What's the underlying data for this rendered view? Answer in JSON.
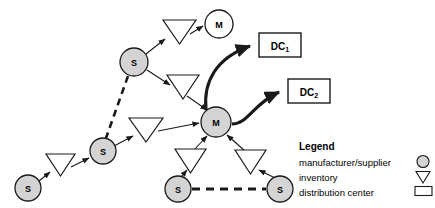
{
  "diagram": {
    "colors": {
      "node_fill_gray": "#d4d4d4",
      "node_fill_white": "#ffffff",
      "stroke": "#1a1a1a",
      "background": "#ffffff"
    },
    "nodes": [
      {
        "id": "m_top",
        "label": "M",
        "type": "manufacturer-supplier",
        "fill": "white",
        "cx": 219,
        "cy": 24,
        "r": 14
      },
      {
        "id": "s_upper",
        "label": "S",
        "type": "manufacturer-supplier",
        "fill": "gray",
        "cx": 134,
        "cy": 62,
        "r": 14
      },
      {
        "id": "m_center",
        "label": "M",
        "type": "manufacturer-supplier",
        "fill": "gray",
        "cx": 216,
        "cy": 122,
        "r": 15
      },
      {
        "id": "s_mid",
        "label": "S",
        "type": "manufacturer-supplier",
        "fill": "gray",
        "cx": 103,
        "cy": 151,
        "r": 13
      },
      {
        "id": "s_left",
        "label": "S",
        "type": "manufacturer-supplier",
        "fill": "gray",
        "cx": 28,
        "cy": 188,
        "r": 13
      },
      {
        "id": "s_bl",
        "label": "S",
        "type": "manufacturer-supplier",
        "fill": "gray",
        "cx": 178,
        "cy": 189,
        "r": 13
      },
      {
        "id": "s_br",
        "label": "S",
        "type": "manufacturer-supplier",
        "fill": "gray",
        "cx": 280,
        "cy": 189,
        "r": 13
      }
    ],
    "inventories": [
      {
        "id": "inv_top",
        "type": "inventory",
        "cx": 178,
        "cy": 30
      },
      {
        "id": "inv_upper2",
        "type": "inventory",
        "cx": 183,
        "cy": 85
      },
      {
        "id": "inv_left",
        "type": "inventory",
        "cx": 146,
        "cy": 128
      },
      {
        "id": "inv_far_l",
        "type": "inventory",
        "cx": 60,
        "cy": 164
      },
      {
        "id": "inv_bl",
        "type": "inventory",
        "cx": 190,
        "cy": 160
      },
      {
        "id": "inv_br",
        "type": "inventory",
        "cx": 250,
        "cy": 161
      }
    ],
    "distribution_centers": [
      {
        "id": "dc1",
        "label": "DC",
        "subscript": "1",
        "type": "distribution-center",
        "x": 259,
        "y": 33,
        "w": 42,
        "h": 24
      },
      {
        "id": "dc2",
        "label": "DC",
        "subscript": "2",
        "type": "distribution-center",
        "x": 288,
        "y": 79,
        "w": 42,
        "h": 24
      }
    ],
    "edges": [
      {
        "from": "s_upper",
        "to": "inv_top",
        "style": "solid"
      },
      {
        "from": "inv_top",
        "to": "m_top",
        "style": "solid"
      },
      {
        "from": "s_upper",
        "to": "inv_upper2",
        "style": "solid"
      },
      {
        "from": "inv_upper2",
        "to": "m_center",
        "style": "solid"
      },
      {
        "from": "s_upper",
        "to": "s_mid",
        "style": "dashed"
      },
      {
        "from": "s_left",
        "to": "inv_far_l",
        "style": "solid"
      },
      {
        "from": "inv_far_l",
        "to": "s_mid",
        "style": "solid"
      },
      {
        "from": "s_mid",
        "to": "inv_left",
        "style": "solid"
      },
      {
        "from": "inv_left",
        "to": "m_center",
        "style": "solid"
      },
      {
        "from": "s_bl",
        "to": "inv_bl",
        "style": "solid"
      },
      {
        "from": "inv_bl",
        "to": "m_center",
        "style": "solid"
      },
      {
        "from": "s_br",
        "to": "inv_br",
        "style": "solid"
      },
      {
        "from": "inv_br",
        "to": "m_center",
        "style": "solid"
      },
      {
        "from": "s_bl",
        "to": "s_br",
        "style": "dashed"
      },
      {
        "from": "m_center",
        "to": "dc1",
        "style": "thick-curved"
      },
      {
        "from": "m_center",
        "to": "dc2",
        "style": "thick-curved"
      }
    ]
  },
  "legend": {
    "title": "Legend",
    "items": [
      {
        "label": "manufacturer/supplier",
        "icon": "circle-icon"
      },
      {
        "label": "inventory",
        "icon": "triangle-down-icon"
      },
      {
        "label": "distribution center",
        "icon": "rectangle-icon"
      }
    ]
  }
}
